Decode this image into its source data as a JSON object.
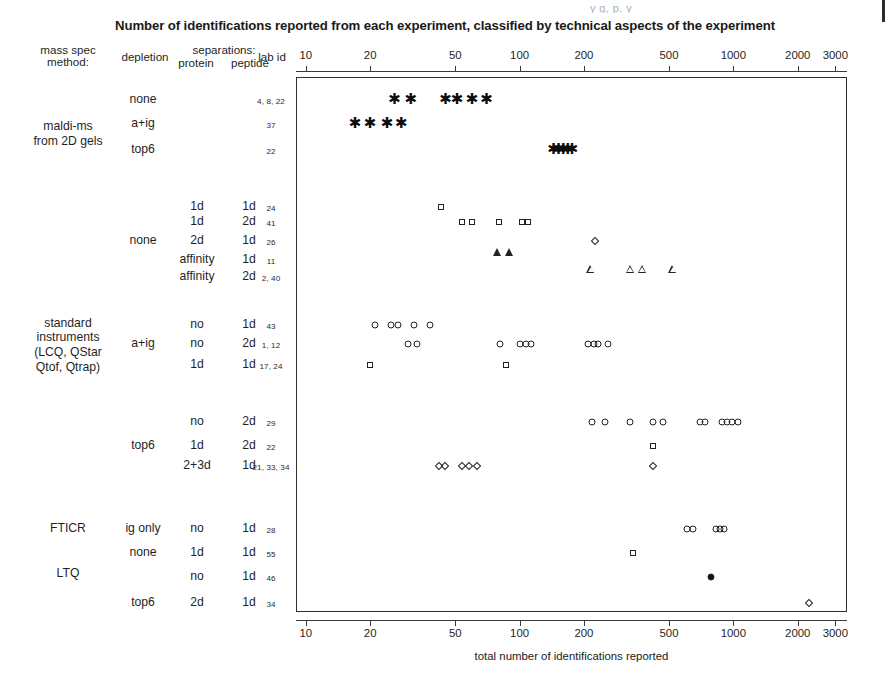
{
  "title": "Number of identifications reported from each experiment, classified by technical aspects of the experiment",
  "scan_artifact_text": "y                    g, p, y",
  "headers": {
    "mass_spec_method": "mass spec\nmethod:",
    "depletion": "depletion",
    "separations": "separations:",
    "protein": "protein",
    "peptide": "peptide",
    "lab_id": "lab id"
  },
  "xaxis": {
    "caption": "total number of identifications reported",
    "scale": "log",
    "ticks": [
      10,
      20,
      50,
      100,
      200,
      500,
      1000,
      2000,
      3000
    ],
    "tick_labels": [
      "10",
      "20",
      "50",
      "100",
      "200",
      "500",
      "1000",
      "2000",
      "3000"
    ],
    "min": 9.0,
    "max": 3400
  },
  "groups": [
    {
      "label": "maldi-ms\nfrom 2D gels",
      "top": 110,
      "bottom": 160
    },
    {
      "label": "standard\ninstruments\n(LCQ, QStar\nQtof, Qtrap)",
      "top": 310,
      "bottom": 382
    },
    {
      "label": "FTICR",
      "top": 529,
      "bottom": 529
    },
    {
      "label": "LTQ",
      "top": 574,
      "bottom": 574
    }
  ],
  "rows": [
    {
      "y": 100,
      "depletion": "none",
      "protein": "",
      "peptide": "",
      "lab_id": "4, 8, 22",
      "marker": "star",
      "values": [
        26,
        31,
        45,
        51,
        60,
        70
      ]
    },
    {
      "y": 124,
      "depletion": "a+ig",
      "protein": "",
      "peptide": "",
      "lab_id": "37",
      "marker": "star",
      "values": [
        17,
        20,
        24,
        28
      ]
    },
    {
      "y": 150,
      "depletion": "top6",
      "protein": "",
      "peptide": "",
      "lab_id": "22",
      "marker": "star",
      "values": [
        144,
        152,
        160,
        168,
        176
      ]
    },
    {
      "y": 207,
      "depletion": "",
      "protein": "1d",
      "peptide": "1d",
      "lab_id": "24",
      "marker": "square",
      "values": [
        43
      ]
    },
    {
      "y": 222,
      "depletion": "",
      "protein": "1d",
      "peptide": "2d",
      "lab_id": "41",
      "marker": "square",
      "values": [
        54,
        60,
        80,
        103,
        110
      ]
    },
    {
      "y": 241,
      "depletion": "none",
      "protein": "2d",
      "peptide": "1d",
      "lab_id": "26",
      "marker": "diamond",
      "values": [
        225
      ]
    },
    {
      "y": 260,
      "depletion": "",
      "protein": "affinity",
      "peptide": "1d",
      "lab_id": "11",
      "marker": "triangle-filled",
      "values": [
        79,
        90
      ]
    },
    {
      "y": 277,
      "depletion": "",
      "protein": "affinity",
      "peptide": "2d",
      "lab_id": "2, 40",
      "marker": "triangle",
      "values": [
        215,
        330,
        375,
        520
      ]
    },
    {
      "y": 325,
      "depletion": "",
      "protein": "no",
      "peptide": "1d",
      "lab_id": "43",
      "marker": "circle",
      "values": [
        21,
        25,
        27,
        32,
        38
      ]
    },
    {
      "y": 344,
      "depletion": "a+ig",
      "protein": "no",
      "peptide": "2d",
      "lab_id": "1, 12",
      "marker": "circle",
      "values": [
        30,
        33,
        81,
        100,
        107,
        113,
        210,
        222,
        233,
        258
      ]
    },
    {
      "y": 365,
      "depletion": "",
      "protein": "1d",
      "peptide": "1d",
      "lab_id": "17, 24",
      "marker": "square",
      "values": [
        20,
        86
      ]
    },
    {
      "y": 422,
      "depletion": "",
      "protein": "no",
      "peptide": "2d",
      "lab_id": "29",
      "marker": "circle",
      "values": [
        218,
        252,
        330,
        420,
        470,
        700,
        740,
        880,
        930,
        990,
        1050
      ]
    },
    {
      "y": 446,
      "depletion": "top6",
      "protein": "1d",
      "peptide": "2d",
      "lab_id": "22",
      "marker": "square",
      "values": [
        420
      ]
    },
    {
      "y": 466,
      "depletion": "",
      "protein": "2+3d",
      "peptide": "1d",
      "lab_id": "21, 33, 34",
      "marker": "diamond",
      "values": [
        42,
        45,
        54,
        58,
        63,
        420
      ]
    },
    {
      "y": 529,
      "depletion": "ig only",
      "protein": "no",
      "peptide": "1d",
      "lab_id": "28",
      "marker": "circle",
      "values": [
        610,
        650,
        830,
        870,
        900
      ]
    },
    {
      "y": 553,
      "depletion": "none",
      "protein": "1d",
      "peptide": "1d",
      "lab_id": "55",
      "marker": "square",
      "values": [
        340
      ]
    },
    {
      "y": 577,
      "depletion": "",
      "protein": "no",
      "peptide": "1d",
      "lab_id": "46",
      "marker": "circle-filled",
      "values": [
        790
      ]
    },
    {
      "y": 603,
      "depletion": "top6",
      "protein": "2d",
      "peptide": "1d",
      "lab_id": "34",
      "marker": "diamond",
      "values": [
        2250
      ]
    }
  ],
  "marker_legend": {
    "star": "asterisk-marker",
    "square": "open-square-marker",
    "circle": "open-circle-marker",
    "diamond": "open-diamond-marker",
    "triangle": "open-triangle-marker"
  },
  "colors": {
    "ink": "#1a1a1a",
    "axis": "#3a3a3a",
    "background": "#ffffff"
  }
}
